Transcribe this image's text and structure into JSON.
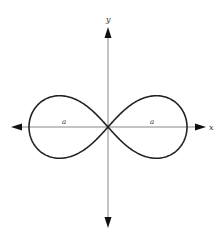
{
  "figure": {
    "type": "lemniscate",
    "axes": {
      "x_label": "x",
      "y_label": "y"
    },
    "annotations": [
      {
        "id": "left-lobe-label",
        "text": "a"
      },
      {
        "id": "right-lobe-label",
        "text": "a"
      }
    ],
    "colors": {
      "curve": "#222222",
      "axis": "#888888",
      "arrow": "#111111",
      "background": "#ffffff"
    },
    "geometry": {
      "origin": [
        108,
        127
      ],
      "half_width_px": 79
    }
  }
}
